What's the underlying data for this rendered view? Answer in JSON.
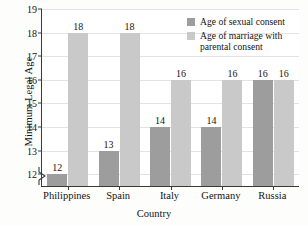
{
  "chart_data": {
    "type": "bar",
    "title": "",
    "xlabel": "Country",
    "ylabel": "Minimum Legal Age",
    "categories": [
      "Philippines",
      "Spain",
      "Italy",
      "Germany",
      "Russia"
    ],
    "series": [
      {
        "name": "Age of sexual consent",
        "color": "#9d9d9d",
        "values": [
          12,
          13,
          14,
          14,
          16
        ]
      },
      {
        "name": "Age of marriage with parental consent",
        "color": "#c9c9c9",
        "values": [
          18,
          18,
          16,
          16,
          16
        ]
      }
    ],
    "ylim": [
      11.5,
      19
    ],
    "yticks": [
      12,
      13,
      14,
      15,
      16,
      17,
      18,
      19
    ],
    "ytick_labels": [
      "12",
      "13",
      "14",
      "15",
      "16",
      "17",
      "18",
      "19"
    ],
    "grid": true,
    "grid_axis": "y",
    "axis_break": true,
    "legend_position": "top-right",
    "bar_value_labels": true,
    "legend": [
      {
        "label": "Age of sexual consent",
        "swatch": "s0"
      },
      {
        "label": "Age of marriage with\nparental consent",
        "swatch": "s1"
      }
    ]
  }
}
